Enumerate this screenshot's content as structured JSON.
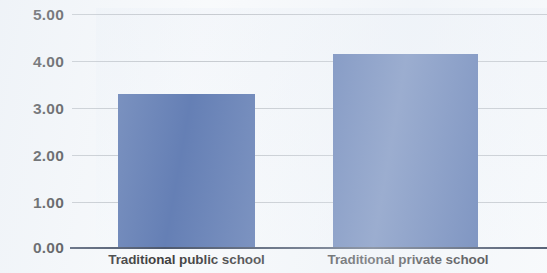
{
  "chart_data": {
    "type": "bar",
    "title": "",
    "subtitle": "",
    "xlabel": "",
    "ylabel": "",
    "categories": [
      "Traditional public school",
      "Traditional private school"
    ],
    "values": [
      3.28,
      4.15
    ],
    "series": [
      {
        "name": "",
        "values": [
          3.28,
          4.15
        ]
      }
    ],
    "ylim": [
      0,
      5
    ],
    "yticks": [
      "0.00",
      "1.00",
      "2.00",
      "3.00",
      "4.00",
      "5.00"
    ],
    "ytick_values": [
      0,
      1,
      2,
      3,
      4,
      5
    ],
    "grid": "horizontal",
    "legend": "none",
    "bar_color": "#4a69a8",
    "gridline_color": "#a8adb4",
    "axis_color": "#2f3c55",
    "background_color": "#f7f9fb"
  },
  "axis": {
    "y": {
      "ticks": [
        {
          "label": "5.00",
          "value": 5
        },
        {
          "label": "4.00",
          "value": 4
        },
        {
          "label": "3.00",
          "value": 3
        },
        {
          "label": "2.00",
          "value": 2
        },
        {
          "label": "1.00",
          "value": 1
        },
        {
          "label": "0.00",
          "value": 0
        }
      ]
    },
    "x": {
      "ticks": [
        {
          "label": "Traditional public school"
        },
        {
          "label": "Traditional private school"
        }
      ]
    }
  }
}
